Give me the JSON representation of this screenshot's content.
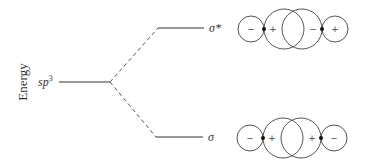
{
  "diagram": {
    "axis_label": "Energy",
    "levels": {
      "hybrid": {
        "label": "sp",
        "superscript": "3"
      },
      "antibonding": {
        "label": "σ*"
      },
      "bonding": {
        "label": "σ"
      }
    },
    "orbitals": {
      "antibonding": {
        "signs": [
          "−",
          "+",
          "−",
          "+"
        ]
      },
      "bonding": {
        "signs": [
          "−",
          "+",
          "+",
          "−"
        ]
      }
    },
    "colors": {
      "line": "#333333",
      "circle": "#555555",
      "text": "#333333"
    }
  }
}
